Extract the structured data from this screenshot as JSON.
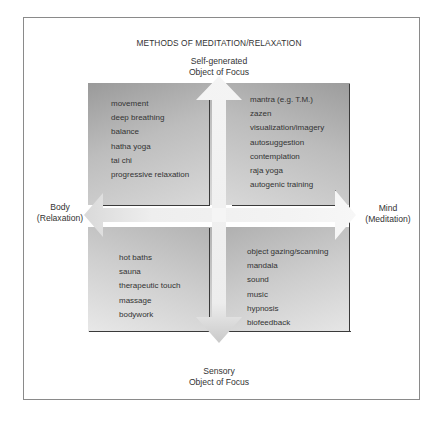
{
  "diagram": {
    "title": "METHODS OF MEDITATION/RELAXATION",
    "axes": {
      "top": {
        "line1": "Self-generated",
        "line2": "Object of Focus"
      },
      "bottom": {
        "line1": "Sensory",
        "line2": "Object of Focus"
      },
      "left": {
        "line1": "Body",
        "line2": "(Relaxation)"
      },
      "right": {
        "line1": "Mind",
        "line2": "(Meditation)"
      }
    },
    "quadrants": {
      "top_left": {
        "position": "Body / Self-generated",
        "items": [
          "movement",
          "deep breathing",
          "balance",
          "hatha yoga",
          "tai chi",
          "progressive relaxation"
        ]
      },
      "top_right": {
        "position": "Mind / Self-generated",
        "items": [
          "mantra (e.g. T.M.)",
          "zazen",
          "visualization/imagery",
          "autosuggestion",
          "contemplation",
          "raja yoga",
          "autogenic training"
        ]
      },
      "bottom_left": {
        "position": "Body / Sensory",
        "items": [
          "hot baths",
          "sauna",
          "therapeutic touch",
          "massage",
          "bodywork"
        ]
      },
      "bottom_right": {
        "position": "Mind / Sensory",
        "items": [
          "object gazing/scanning",
          "mandala",
          "sound",
          "music",
          "hypnosis",
          "biofeedback"
        ]
      }
    },
    "colors": {
      "frame_border": "#8a8a8a",
      "quadrant_dark": "#9a9a9a",
      "quadrant_light": "#dcdcdc",
      "arrow_fill": "#eeeeee",
      "text": "#333333"
    }
  }
}
